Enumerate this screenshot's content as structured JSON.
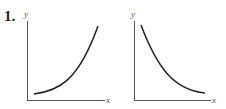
{
  "problem": {
    "number": "1."
  },
  "graphs": [
    {
      "id": "left",
      "x_label": "x",
      "y_label": "y",
      "curve": "increasing exponential (concave up)"
    },
    {
      "id": "right",
      "x_label": "x",
      "y_label": "y",
      "curve": "decreasing exponential (concave up)"
    }
  ],
  "colors": {
    "axis": "#444444",
    "curve": "#222222"
  }
}
